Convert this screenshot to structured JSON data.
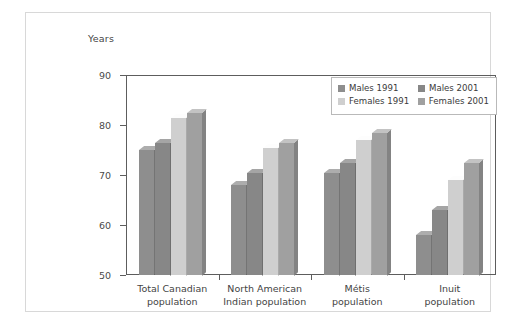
{
  "chart_data": {
    "type": "bar",
    "title": "",
    "xlabel": "",
    "ylabel": "Years",
    "ylim": [
      50,
      90
    ],
    "yticks": [
      50,
      60,
      70,
      80,
      90
    ],
    "grid": false,
    "legend_position": "top-right",
    "categories": [
      "Total Canadian\npopulation",
      "North American\nIndian population",
      "Métis\npopulation",
      "Inuit\npopulation"
    ],
    "category_lines": [
      [
        "Total Canadian",
        "population"
      ],
      [
        "North American",
        "Indian population"
      ],
      [
        "Métis",
        "population"
      ],
      [
        "Inuit",
        "population"
      ]
    ],
    "series": [
      {
        "name": "Males 1991",
        "color": "#8e8e8e",
        "values": [
          75.0,
          68.0,
          70.5,
          58.0
        ]
      },
      {
        "name": "Males 2001",
        "color": "#878787",
        "values": [
          76.5,
          70.5,
          72.5,
          63.0
        ]
      },
      {
        "name": "Females 1991",
        "color": "#cfcfcf",
        "values": [
          81.5,
          75.5,
          77.0,
          69.0
        ]
      },
      {
        "name": "Females 2001",
        "color": "#a0a0a0",
        "values": [
          82.5,
          76.5,
          78.5,
          72.5
        ]
      }
    ]
  },
  "axis": {
    "y_title": "Years",
    "tick_labels": [
      "90",
      "80",
      "70",
      "60",
      "50"
    ]
  },
  "legend": {
    "items": [
      {
        "label": "Males 1991",
        "swatch": "#8e8e8e"
      },
      {
        "label": "Males 2001",
        "swatch": "#878787"
      },
      {
        "label": "Females 1991",
        "swatch": "#cfcfcf"
      },
      {
        "label": "Females 2001",
        "swatch": "#a0a0a0"
      }
    ]
  }
}
